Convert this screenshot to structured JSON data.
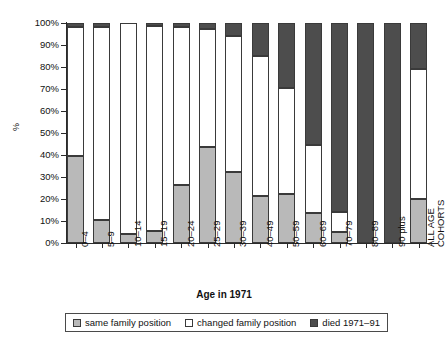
{
  "chart_data": {
    "type": "bar",
    "subtype": "stacked-bar-100-percent",
    "title": "",
    "xlabel": "Age in 1971",
    "ylabel": "%",
    "ylim": [
      0,
      100
    ],
    "grid": false,
    "legend_position": "bottom",
    "categories": [
      "0–4",
      "5–9",
      "10–14",
      "15–19",
      "20–24",
      "25–29",
      "30–39",
      "40–49",
      "50–59",
      "60–69",
      "70–79",
      "80–89",
      "90 plus",
      "ALL AGE COHORTS"
    ],
    "series": [
      {
        "name": "same family position",
        "color": "#b9b9b9",
        "values": [
          39.5,
          10.5,
          4.0,
          5.5,
          26.5,
          43.5,
          32.5,
          21.5,
          22.5,
          13.5,
          5.0,
          0.0,
          0.0,
          20.0
        ]
      },
      {
        "name": "changed family position",
        "color": "#ffffff",
        "values": [
          58.5,
          87.5,
          96.0,
          93.0,
          71.5,
          54.0,
          61.5,
          63.5,
          48.0,
          31.0,
          9.0,
          0.0,
          0.0,
          59.0
        ]
      },
      {
        "name": "died 1971–91",
        "color": "#4d4d4d",
        "values": [
          2.0,
          2.0,
          0.0,
          1.5,
          2.0,
          2.5,
          6.0,
          15.0,
          29.5,
          55.5,
          86.0,
          100.0,
          100.0,
          21.0
        ]
      }
    ],
    "y_ticks": [
      "0%",
      "10%",
      "20%",
      "30%",
      "40%",
      "50%",
      "60%",
      "70%",
      "80%",
      "90%",
      "100%"
    ],
    "y_tick_values": [
      0,
      10,
      20,
      30,
      40,
      50,
      60,
      70,
      80,
      90,
      100
    ]
  },
  "axes": {
    "y_title": "%",
    "x_title": "Age in 1971"
  },
  "legend": {
    "items": [
      {
        "label": "same family position",
        "swatch": "#b9b9b9"
      },
      {
        "label": "changed family position",
        "swatch": "#ffffff"
      },
      {
        "label": "died 1971–91",
        "swatch": "#4d4d4d"
      }
    ]
  }
}
